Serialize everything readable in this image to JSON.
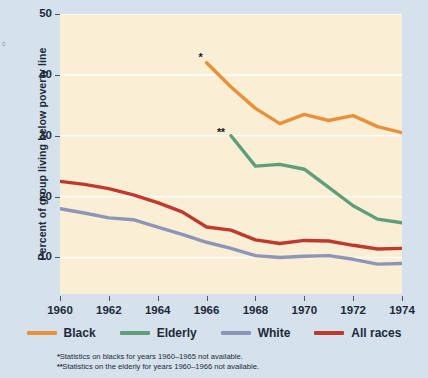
{
  "axes": {
    "ylabel": "Percent of group living below poverty line",
    "yticks": [
      50,
      40,
      30,
      20,
      10
    ],
    "xticks": [
      1960,
      1962,
      1964,
      1966,
      1968,
      1970,
      1972,
      1974
    ]
  },
  "marks": {
    "black_star": "*",
    "elderly_star": "**"
  },
  "legend": [
    {
      "label": "Black",
      "color": "#e8913a"
    },
    {
      "label": "Elderly",
      "color": "#5e9e78"
    },
    {
      "label": "White",
      "color": "#8e96b8"
    },
    {
      "label": "All races",
      "color": "#c0392f"
    }
  ],
  "footnotes": [
    {
      "marker": "*",
      "text": "Statistics on blacks for years 1960–1965 not available."
    },
    {
      "marker": "**",
      "text": "Statistics on the elderly for years 1960–1966 not available."
    }
  ],
  "colors": {
    "page_background": "#d5e1ec",
    "plot_background": "#faeed4",
    "gridline": "#ffffff",
    "text": "#1c2a38"
  },
  "chart_data": {
    "type": "line",
    "title": "",
    "xlabel": "",
    "ylabel": "Percent of group living below poverty line",
    "xlim": [
      1960,
      1974
    ],
    "ylim": [
      4,
      50
    ],
    "grid": true,
    "legend_position": "bottom",
    "series": [
      {
        "name": "Black",
        "color": "#e8913a",
        "x": [
          1966,
          1967,
          1968,
          1969,
          1970,
          1971,
          1972,
          1973,
          1974
        ],
        "values": [
          42.0,
          38.0,
          34.5,
          32.0,
          33.5,
          32.5,
          33.3,
          31.5,
          30.5
        ]
      },
      {
        "name": "Elderly",
        "color": "#5e9e78",
        "x": [
          1967,
          1968,
          1969,
          1970,
          1971,
          1972,
          1973,
          1974
        ],
        "values": [
          30.0,
          25.0,
          25.3,
          24.5,
          21.5,
          18.5,
          16.3,
          15.7
        ]
      },
      {
        "name": "White",
        "color": "#8e96b8",
        "x": [
          1960,
          1961,
          1962,
          1963,
          1964,
          1965,
          1966,
          1967,
          1968,
          1969,
          1970,
          1971,
          1972,
          1973,
          1974
        ],
        "values": [
          18.0,
          17.3,
          16.5,
          16.2,
          15.0,
          13.8,
          12.5,
          11.5,
          10.3,
          10.0,
          10.2,
          10.3,
          9.7,
          8.9,
          9.0
        ]
      },
      {
        "name": "All races",
        "color": "#c0392f",
        "x": [
          1960,
          1961,
          1962,
          1963,
          1964,
          1965,
          1966,
          1967,
          1968,
          1969,
          1970,
          1971,
          1972,
          1973,
          1974
        ],
        "values": [
          22.5,
          22.0,
          21.3,
          20.3,
          19.0,
          17.5,
          15.0,
          14.5,
          12.9,
          12.3,
          12.8,
          12.7,
          12.0,
          11.4,
          11.5
        ]
      }
    ]
  }
}
